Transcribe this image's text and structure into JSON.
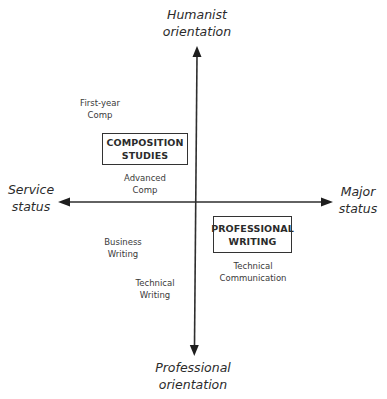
{
  "diagram": {
    "type": "quadrant-diagram",
    "axes": {
      "top": {
        "line1": "Humanist",
        "line2": "orientation"
      },
      "bottom": {
        "line1": "Professional",
        "line2": "orientation"
      },
      "left": {
        "line1": "Service",
        "line2": "status"
      },
      "right": {
        "line1": "Major",
        "line2": "status"
      }
    },
    "fields": [
      {
        "line1": "COMPOSITION",
        "line2": "STUDIES"
      },
      {
        "line1": "PROFESSIONAL",
        "line2": "WRITING"
      }
    ],
    "items": [
      {
        "line1": "First-year",
        "line2": "Comp"
      },
      {
        "line1": "Advanced",
        "line2": "Comp"
      },
      {
        "line1": "Business",
        "line2": "Writing"
      },
      {
        "line1": "Technical",
        "line2": "Writing"
      },
      {
        "line1": "Technical",
        "line2": "Communication"
      }
    ],
    "colors": {
      "line": "#2e2e2e",
      "text": "#2b2b2b",
      "background": "#ffffff"
    }
  }
}
